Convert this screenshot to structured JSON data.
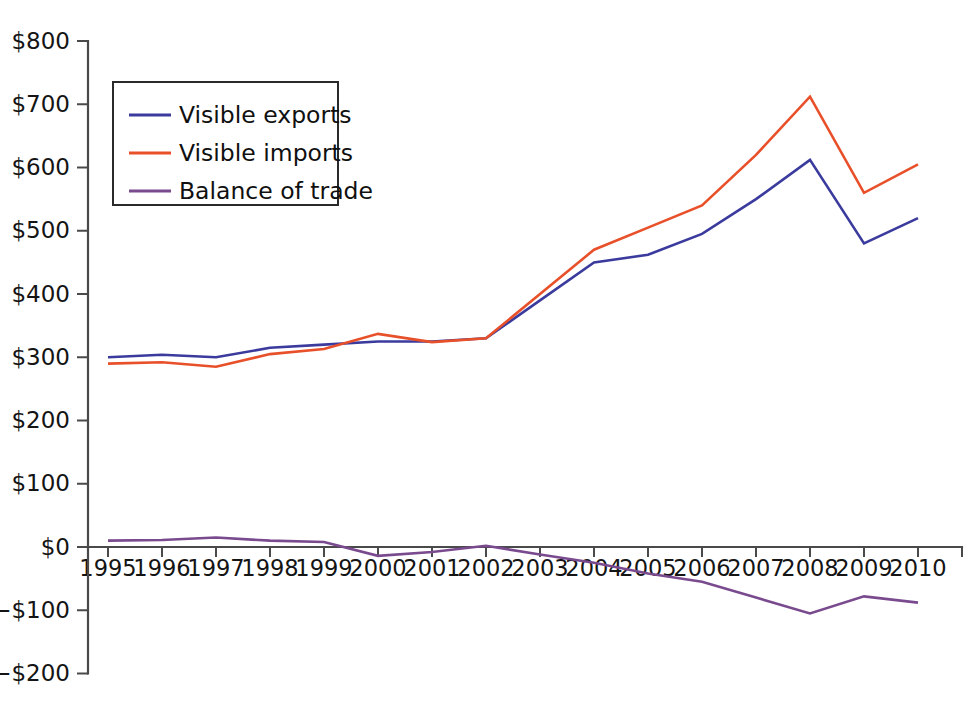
{
  "page": {
    "background_color": "#ffffff",
    "top_cut_text": ""
  },
  "chart_data": {
    "type": "line",
    "title": "",
    "subtitle": "",
    "xlabel": "",
    "ylabel": "",
    "x": [
      1995,
      1996,
      1997,
      1998,
      1999,
      2000,
      2001,
      2002,
      2003,
      2004,
      2005,
      2006,
      2007,
      2008,
      2009,
      2010
    ],
    "categories": [
      "1995",
      "1996",
      "1997",
      "1998",
      "1999",
      "2000",
      "2001",
      "2002",
      "2003",
      "2004",
      "2005",
      "2006",
      "2007",
      "2008",
      "2009",
      "2010"
    ],
    "series": [
      {
        "name": "Visible exports",
        "color": "#3b3b9e",
        "values": [
          300,
          304,
          300,
          315,
          320,
          325,
          325,
          330,
          390,
          450,
          462,
          495,
          550,
          612,
          480,
          520
        ]
      },
      {
        "name": "Visible imports",
        "color": "#e8502a",
        "values": [
          290,
          292,
          285,
          305,
          313,
          337,
          324,
          330,
          400,
          470,
          505,
          540,
          620,
          712,
          560,
          605
        ]
      },
      {
        "name": "Balance of trade",
        "color": "#7a4a8f",
        "values": [
          10,
          11,
          15,
          10,
          8,
          -14,
          -8,
          2,
          -12,
          -25,
          -42,
          -55,
          -80,
          -105,
          -78,
          -88
        ]
      }
    ],
    "ylim": [
      -200,
      800
    ],
    "ytick_values": [
      800,
      700,
      600,
      500,
      400,
      300,
      200,
      100,
      0,
      -100,
      -200
    ],
    "ytick_labels": [
      "$800",
      "$700",
      "$600",
      "$500",
      "$400",
      "$300",
      "$200",
      "$100",
      "$0",
      "−$100",
      "−$200"
    ],
    "grid": false,
    "legend_position": "upper-left",
    "legend_entries": [
      {
        "label": "Visible exports",
        "color": "#3b3b9e"
      },
      {
        "label": "Visible imports",
        "color": "#e8502a"
      },
      {
        "label": "Balance of trade",
        "color": "#7a4a8f"
      }
    ]
  },
  "axes": {
    "y_axis_name": "y-axis",
    "x_axis_name": "x-axis"
  }
}
